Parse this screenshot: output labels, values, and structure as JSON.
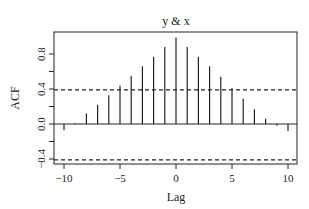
{
  "chart_data": {
    "type": "bar",
    "subtype": "acf-stem",
    "title": "y & x",
    "xlabel": "Lag",
    "ylabel": "ACF",
    "x": [
      -10,
      -9,
      -8,
      -7,
      -6,
      -5,
      -4,
      -3,
      -2,
      -1,
      0,
      1,
      2,
      3,
      4,
      5,
      6,
      7,
      8,
      9,
      10
    ],
    "values": [
      -0.07,
      0.01,
      0.12,
      0.22,
      0.33,
      0.44,
      0.55,
      0.66,
      0.77,
      0.88,
      0.99,
      0.88,
      0.77,
      0.66,
      0.54,
      0.41,
      0.29,
      0.17,
      0.06,
      -0.02,
      -0.08
    ],
    "xlim": [
      -10.8,
      10.8
    ],
    "ylim": [
      -0.46,
      1.04
    ],
    "xticks": [
      -10,
      -5,
      0,
      5,
      10
    ],
    "xtick_labels": [
      "−10",
      "−5",
      "0",
      "5",
      "10"
    ],
    "yticks": [
      -0.4,
      0.0,
      0.4,
      0.8
    ],
    "ytick_labels": [
      "−0.4",
      "0.0",
      "0.4",
      "0.8"
    ],
    "yminor_ticks": [
      -0.2,
      0.2,
      0.6
    ],
    "confidence_bounds": [
      0.39,
      -0.41
    ],
    "grid": false,
    "legend": null
  },
  "colors": {
    "line": "#222222",
    "background": "#ffffff"
  }
}
